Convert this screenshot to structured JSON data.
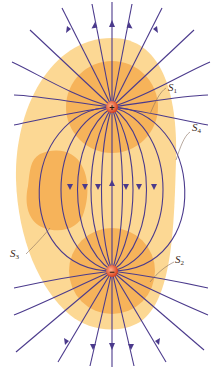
{
  "figure": {
    "colors": {
      "background": "#ffffff",
      "outer_surface_fill": "#fcd894",
      "inner_surface_fill": "#f6b35a",
      "field_line": "#4b3a8c",
      "charge_fill": "#e0502a"
    },
    "charges": [
      {
        "sign": "+",
        "symbol": "+",
        "x": 112,
        "y": 107
      },
      {
        "sign": "-",
        "symbol": "−",
        "x": 112,
        "y": 271
      }
    ],
    "surfaces": [
      {
        "name": "S",
        "sub": "1",
        "label_x": 168,
        "label_y": 90
      },
      {
        "name": "S",
        "sub": "4",
        "label_x": 192,
        "label_y": 130
      },
      {
        "name": "S",
        "sub": "3",
        "label_x": 12,
        "label_y": 256
      },
      {
        "name": "S",
        "sub": "2",
        "label_x": 176,
        "label_y": 262
      }
    ]
  }
}
